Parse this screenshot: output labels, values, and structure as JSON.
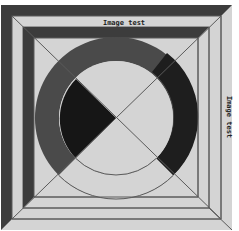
{
  "labels": {
    "top": "Image test",
    "right": "Image test"
  },
  "colors": {
    "background": "#ffffff",
    "light_fill": "#d4d4d4",
    "dark_band": "#3c3c3c",
    "ring_medium": "#4a4a4a",
    "ring_dark": "#1e1e1e",
    "wedge": "#161616",
    "line": "#5a5a5a"
  }
}
